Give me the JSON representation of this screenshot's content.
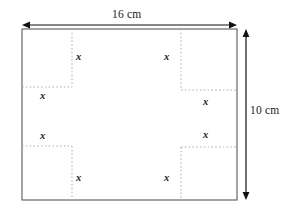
{
  "diagram": {
    "type": "geometry-figure",
    "shape": "rectangle-with-four-corner-notches",
    "colors": {
      "outline": "#555555",
      "dotted": "#b0b0b0",
      "arrow": "#111111",
      "text": "#1a1a1a",
      "background": "#ffffff"
    },
    "rectangle": {
      "left": 22,
      "top": 29,
      "right": 237,
      "bottom": 200
    },
    "dimensions": {
      "width": {
        "value": "16",
        "unit": "cm",
        "label": "16 cm",
        "arrow_y": 25,
        "arrow_x1": 22,
        "arrow_x2": 237
      },
      "height": {
        "value": "10",
        "unit": "cm",
        "label": "10 cm",
        "arrow_x": 246,
        "arrow_y1": 29,
        "arrow_y2": 200
      }
    },
    "notches": [
      {
        "id": "top-left",
        "vline_x": 72,
        "vline_y1": 29,
        "vline_y2": 87,
        "hline_y": 87,
        "hline_x1": 22,
        "hline_x2": 72
      },
      {
        "id": "top-right",
        "vline_x": 181,
        "vline_y1": 29,
        "vline_y2": 90,
        "hline_y": 90,
        "hline_x1": 181,
        "hline_x2": 237
      },
      {
        "id": "bottom-left",
        "vline_x": 72,
        "vline_y1": 146,
        "vline_y2": 200,
        "hline_y": 146,
        "hline_x1": 22,
        "hline_x2": 72
      },
      {
        "id": "bottom-right",
        "vline_x": 181,
        "vline_y1": 147,
        "vline_y2": 200,
        "hline_y": 147,
        "hline_x1": 181,
        "hline_x2": 237
      }
    ],
    "variable_labels": [
      {
        "id": "x-top-left-vertical",
        "text": "x",
        "x": 76,
        "y": 51
      },
      {
        "id": "x-top-left-horizontal",
        "text": "x",
        "x": 40,
        "y": 90
      },
      {
        "id": "x-top-right-vertical",
        "text": "x",
        "x": 164,
        "y": 51
      },
      {
        "id": "x-top-right-horizontal",
        "text": "x",
        "x": 203,
        "y": 96
      },
      {
        "id": "x-bottom-left-horizontal",
        "text": "x",
        "x": 40,
        "y": 130
      },
      {
        "id": "x-bottom-left-vertical",
        "text": "x",
        "x": 76,
        "y": 172
      },
      {
        "id": "x-bottom-right-horizontal",
        "text": "x",
        "x": 203,
        "y": 129
      },
      {
        "id": "x-bottom-right-vertical",
        "text": "x",
        "x": 164,
        "y": 172
      }
    ]
  }
}
